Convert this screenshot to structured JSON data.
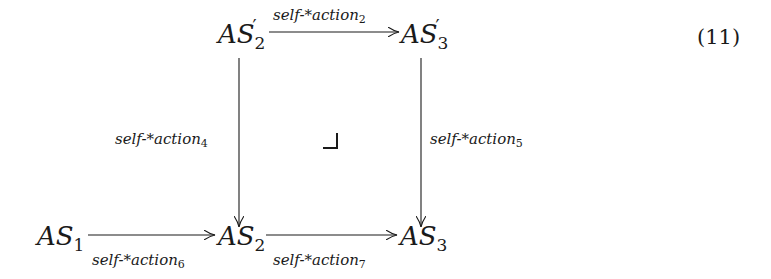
{
  "equation_number": "(11)",
  "nodes": {
    "as2_prime": {
      "base": "AS",
      "sub": "2",
      "prime": "′"
    },
    "as3_prime": {
      "base": "AS",
      "sub": "3",
      "prime": "′"
    },
    "as1": {
      "base": "AS",
      "sub": "1"
    },
    "as2": {
      "base": "AS",
      "sub": "2"
    },
    "as3": {
      "base": "AS",
      "sub": "3"
    }
  },
  "edges": {
    "top": {
      "text": "self-*action",
      "sub": "2",
      "from": "AS'2",
      "to": "AS'3"
    },
    "left": {
      "text": "self-*action",
      "sub": "4",
      "from": "AS'2",
      "to": "AS2"
    },
    "right": {
      "text": "self-*action",
      "sub": "5",
      "from": "AS'3",
      "to": "AS3"
    },
    "bottom_left": {
      "text": "self-*action",
      "sub": "6",
      "from": "AS1",
      "to": "AS2"
    },
    "bottom_right": {
      "text": "self-*action",
      "sub": "7",
      "from": "AS2",
      "to": "AS3"
    }
  },
  "pullback_marker": "⌟"
}
